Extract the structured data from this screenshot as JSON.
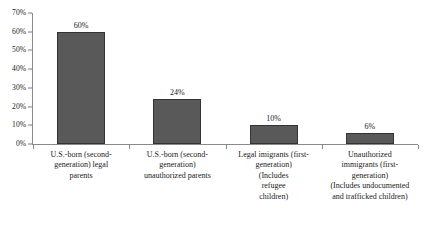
{
  "chart_data": {
    "type": "bar",
    "title": "",
    "xlabel": "",
    "ylabel": "",
    "ylim": [
      0,
      70
    ],
    "grid": false,
    "legend": false,
    "y_tick_labels": [
      "70%",
      "60%",
      "50%",
      "40%",
      "30%",
      "20%",
      "10%",
      "0%"
    ],
    "y_ticks": [
      70,
      60,
      50,
      40,
      30,
      20,
      10,
      0
    ],
    "categories": [
      "U.S.-born (second-generation) legal parents",
      "U.S.-born (second-generation) unauthorized parents",
      "Legal imigrants (first-generation) (Includes refugee children)",
      "Unauthorized immigrants (first-generation) (Includes undocumented and trafficked children)"
    ],
    "category_lines": [
      [
        "U.S.-born (second-",
        "generation) legal",
        "parents"
      ],
      [
        "U.S.-born (second-",
        "generation)",
        "unauthorized parents"
      ],
      [
        "Legal imigrants (first-",
        "generation)",
        "(Includes",
        "refugee",
        "children)"
      ],
      [
        "Unauthorized",
        "immigrants (first-",
        "generation)",
        "(Includes undocumented",
        "and trafficked children)"
      ]
    ],
    "values": [
      60,
      24,
      10,
      6
    ],
    "value_labels": [
      "60%",
      "24%",
      "10%",
      "6%"
    ],
    "colors": {
      "bar_fill": "#595959",
      "bar_outline": "#333333",
      "axis": "#8a8a8a",
      "text": "#1a1a1a",
      "background": "#ffffff"
    }
  }
}
